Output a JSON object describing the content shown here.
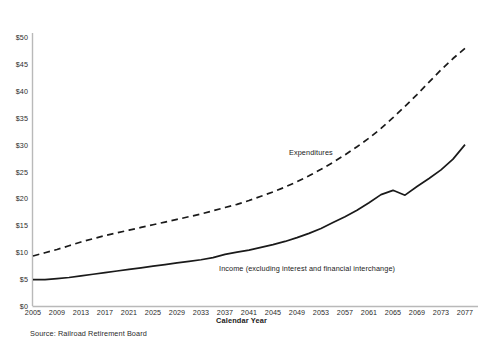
{
  "chart_data": {
    "type": "line",
    "title": "",
    "subtitle": "",
    "xlabel": "Calendar Year",
    "ylabel": "",
    "xlim": [
      2005,
      2077
    ],
    "ylim": [
      0,
      50
    ],
    "grid": false,
    "legend_position": "inline-annotations",
    "y_tick_labels": [
      "$50",
      "$45",
      "$40",
      "$35",
      "$30",
      "$25",
      "$20",
      "$15",
      "$10",
      "$5",
      "$0"
    ],
    "y_tick_values": [
      50,
      45,
      40,
      35,
      30,
      25,
      20,
      15,
      10,
      5,
      0
    ],
    "x_tick_labels": [
      "2005",
      "2009",
      "2013",
      "2017",
      "2021",
      "2025",
      "2029",
      "2033",
      "2037",
      "2041",
      "2045",
      "2049",
      "2053",
      "2057",
      "2061",
      "2065",
      "2069",
      "2073",
      "2077"
    ],
    "x_tick_values": [
      2005,
      2009,
      2013,
      2017,
      2021,
      2025,
      2029,
      2033,
      2037,
      2041,
      2045,
      2049,
      2053,
      2057,
      2061,
      2065,
      2069,
      2073,
      2077
    ],
    "source": "Source: Railroad Retirement Board",
    "series": [
      {
        "name": "Expenditures",
        "style": "dashed",
        "color": "#1a1a1a",
        "x": [
          2005,
          2007,
          2009,
          2011,
          2013,
          2015,
          2017,
          2019,
          2021,
          2023,
          2025,
          2027,
          2029,
          2031,
          2033,
          2035,
          2037,
          2039,
          2041,
          2043,
          2045,
          2047,
          2049,
          2051,
          2053,
          2055,
          2057,
          2059,
          2061,
          2063,
          2065,
          2067,
          2069,
          2071,
          2073,
          2075,
          2077
        ],
        "values": [
          9.3,
          9.9,
          10.5,
          11.2,
          11.9,
          12.5,
          13.1,
          13.6,
          14.1,
          14.6,
          15.1,
          15.6,
          16.1,
          16.6,
          17.1,
          17.7,
          18.3,
          18.9,
          19.6,
          20.4,
          21.2,
          22.1,
          23.1,
          24.2,
          25.4,
          26.7,
          28.1,
          29.6,
          31.2,
          33.0,
          35.0,
          37.1,
          39.3,
          41.6,
          43.9,
          46.0,
          47.9
        ]
      },
      {
        "name": "Income (excluding interest and financial interchange)",
        "style": "solid",
        "color": "#1a1a1a",
        "x": [
          2005,
          2007,
          2009,
          2011,
          2013,
          2015,
          2017,
          2019,
          2021,
          2023,
          2025,
          2027,
          2029,
          2031,
          2033,
          2035,
          2037,
          2039,
          2041,
          2043,
          2045,
          2047,
          2049,
          2051,
          2053,
          2055,
          2057,
          2059,
          2061,
          2063,
          2065,
          2067,
          2069,
          2071,
          2073,
          2075,
          2077
        ],
        "values": [
          4.9,
          4.9,
          5.1,
          5.3,
          5.6,
          5.9,
          6.2,
          6.5,
          6.8,
          7.1,
          7.4,
          7.7,
          8.0,
          8.3,
          8.6,
          9.0,
          9.6,
          10.0,
          10.4,
          10.9,
          11.4,
          12.0,
          12.7,
          13.5,
          14.4,
          15.5,
          16.6,
          17.8,
          19.2,
          20.7,
          21.5,
          20.6,
          22.2,
          23.7,
          25.3,
          27.3,
          30.0
        ]
      }
    ],
    "annotations": [
      {
        "text": "Expenditures",
        "x": 2048,
        "y": 26
      },
      {
        "text": "Income (excluding interest and financial interchange)",
        "x": 2036,
        "y": 7
      }
    ]
  },
  "axis": {
    "x_title": "Calendar Year"
  }
}
